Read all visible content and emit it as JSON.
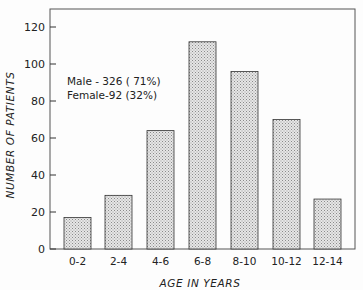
{
  "chart_data": {
    "type": "bar",
    "title": "",
    "xlabel": "AGE IN YEARS",
    "ylabel": "NUMBER OF PATIENTS",
    "categories": [
      "0-2",
      "2-4",
      "4-6",
      "6-8",
      "8-10",
      "10-12",
      "12-14"
    ],
    "values": [
      17,
      29,
      64,
      112,
      96,
      70,
      27
    ],
    "ylim": [
      0,
      130
    ],
    "yticks": [
      0,
      20,
      40,
      60,
      80,
      100,
      120
    ],
    "grid": false,
    "annotations": [
      "Male - 326 ( 71%)",
      "Female-92 (32%)"
    ],
    "bar_fill": "stippled light gray"
  },
  "labels": {
    "xlabel": "AGE IN YEARS",
    "ylabel": "NUMBER OF PATIENTS",
    "annotation_male": "Male - 326 ( 71%)",
    "annotation_female": "Female-92 (32%)"
  },
  "colors": {
    "bar_fill": "#d4d4d4",
    "bar_stroke": "#333333",
    "axis": "#333333"
  }
}
